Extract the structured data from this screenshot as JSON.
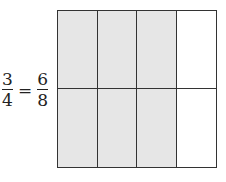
{
  "equation": {
    "left": {
      "numerator": "3",
      "denominator": "4"
    },
    "operator": "=",
    "right": {
      "numerator": "6",
      "denominator": "8"
    }
  },
  "grid": {
    "rows": 2,
    "columns": 4,
    "shaded_color": "#e6e6e6",
    "unshaded_color": "#ffffff",
    "line_color": "#333333",
    "cells": [
      [
        true,
        true,
        true,
        false
      ],
      [
        true,
        true,
        true,
        false
      ]
    ]
  }
}
